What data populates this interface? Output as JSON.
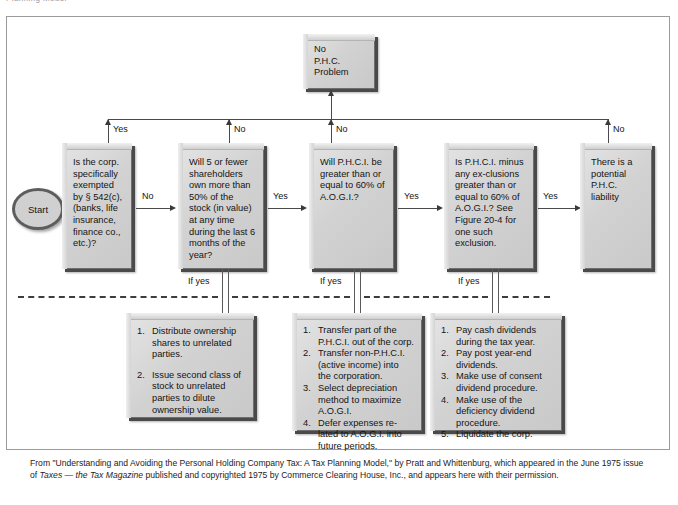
{
  "page": {
    "clipped_header": "Planning Model",
    "colors": {
      "box_fill": "#d4d4d4",
      "box_border": "#6e6e6e",
      "shadow": "#4a4a4a",
      "line": "#4a4a4a",
      "frame": "#9b9b9b"
    }
  },
  "nodes": {
    "start": {
      "label": "Start"
    },
    "no_phc": {
      "lines": [
        "No",
        "P.H.C.",
        "Problem"
      ]
    },
    "d1": {
      "text": "Is the corp. specifically exempted by § 542(c), (banks, life insurance, finance co., etc.)?"
    },
    "d2": {
      "text": "Will 5 or fewer shareholders own more than 50% of the stock (in value) at any time during the last 6 months of the year?"
    },
    "d3": {
      "text": "Will P.H.C.I. be greater than or equal to 60% of A.O.G.I.?"
    },
    "d4": {
      "text": "Is P.H.C.I. minus any ex-clusions greater than or equal to 60% of A.O.G.I.? See Figure 20-4 for one such exclusion."
    },
    "d5": {
      "text": "There is a potential P.H.C. liability"
    }
  },
  "edge_labels": {
    "top_yes_1": "Yes",
    "top_no_2": "No",
    "top_no_3": "No",
    "top_no_5": "No",
    "mid_no_1to2": "No",
    "mid_yes_2to3": "Yes",
    "mid_yes_3to4": "Yes",
    "mid_yes_4to5": "Yes",
    "if_yes_1": "If yes",
    "if_yes_2": "If yes",
    "if_yes_3": "If yes"
  },
  "actions": {
    "a1": {
      "items": [
        {
          "n": "1.",
          "text": "Distribute ownership shares to unrelated parties."
        },
        {
          "n": "2.",
          "text": "Issue second class of stock to unrelated parties to dilute ownership value."
        }
      ]
    },
    "a2": {
      "items": [
        {
          "n": "1.",
          "text": "Transfer part of the P.H.C.I. out of the corp."
        },
        {
          "n": "2.",
          "text": "Transfer non-P.H.C.I. (active income) into the corporation."
        },
        {
          "n": "3.",
          "text": "Select depreciation method to maximize A.O.G.I."
        },
        {
          "n": "4.",
          "text": "Defer expenses re-lated to A.O.G.I. into future periods."
        }
      ]
    },
    "a3": {
      "items": [
        {
          "n": "1.",
          "text": "Pay cash dividends during the tax year."
        },
        {
          "n": "2.",
          "text": "Pay post year-end dividends."
        },
        {
          "n": "3.",
          "text": "Make use of consent dividend procedure."
        },
        {
          "n": "4.",
          "text": "Make use of the deficiency dividend procedure."
        },
        {
          "n": "5.",
          "text": "Liquidate the corp."
        }
      ]
    }
  },
  "footer": {
    "part1": "From \"Understanding and Avoiding the Personal Holding Company Tax: A Tax Planning Model,\" by Pratt and Whittenburg, which appeared in the June 1975 issue of ",
    "italic1": "Taxes — the Tax Magazine",
    "part2": " published and copyrighted 1975 by Commerce Clearing House, Inc., and appears here with their permission."
  }
}
